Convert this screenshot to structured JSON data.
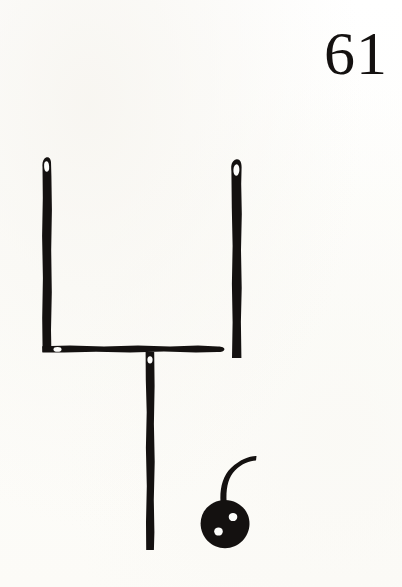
{
  "page": {
    "number": "61",
    "background_color": "#fdfdfb",
    "ink_color": "#141110",
    "width": 402,
    "height": 587
  },
  "illustration": {
    "title": "goalpost-and-button-line-drawing",
    "description": "Hand-inked line drawing of an upright goalpost shape beside a two-hole button with a curved thread",
    "parts": [
      {
        "name": "left-upright",
        "shape": "vertical-bar-with-eyelet",
        "x": 42,
        "y": 157,
        "width": 9,
        "height": 201,
        "eyelet": true
      },
      {
        "name": "right-upright",
        "shape": "vertical-bar-with-eyelet",
        "x": 231,
        "y": 159,
        "width": 10,
        "height": 199,
        "eyelet": true
      },
      {
        "name": "crossbar",
        "shape": "horizontal-bar",
        "x": 42,
        "y": 345,
        "width": 183,
        "height": 9,
        "eyelet": true
      },
      {
        "name": "center-post",
        "shape": "vertical-bar-with-eyelet",
        "x": 145,
        "y": 352,
        "width": 9,
        "height": 198,
        "eyelet": true
      },
      {
        "name": "button",
        "shape": "circle-with-two-holes",
        "cx": 225,
        "cy": 524,
        "r": 24,
        "holes": 2
      },
      {
        "name": "thread",
        "shape": "curved-stem",
        "from_x": 224,
        "from_y": 505,
        "to_x": 256,
        "to_y": 457
      }
    ]
  }
}
